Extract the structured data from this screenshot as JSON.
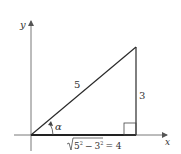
{
  "diagram": {
    "type": "right-triangle",
    "axes": {
      "x_label": "x",
      "y_label": "y"
    },
    "sides": {
      "hypotenuse": "5",
      "opposite": "3",
      "adjacent_radicand_base": "5",
      "adjacent_exp": "2",
      "adjacent_minus": "−",
      "adjacent_sub_base": "3",
      "adjacent_result": "= 4",
      "adjacent_full": "√(5² − 3²) = 4"
    },
    "angle_label": "α",
    "right_angle_marker": true,
    "colors": {
      "line": "#2a2a2a",
      "axis": "#555555",
      "text": "#333333"
    }
  }
}
